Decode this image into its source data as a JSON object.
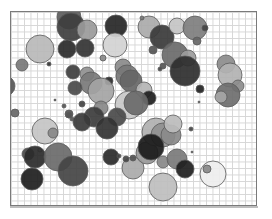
{
  "figure": {
    "frame": {
      "x": 10,
      "y": 11,
      "width": 247,
      "height": 195
    },
    "grid_spacing": 6.5,
    "colors": {
      "grid": "#d6d6d6",
      "border": "#7a7a7a",
      "stroke": "#5a5a5a"
    },
    "circles": [
      {
        "cx": 68,
        "cy": 16,
        "r": 12,
        "fill": "#5c5c5c"
      },
      {
        "cx": 70,
        "cy": 26,
        "r": 14,
        "fill": "#3e3e3e"
      },
      {
        "cx": 86,
        "cy": 29,
        "r": 10,
        "fill": "#9a9a9a"
      },
      {
        "cx": 66,
        "cy": 48,
        "r": 9,
        "fill": "#2a2a2a"
      },
      {
        "cx": 84,
        "cy": 47,
        "r": 9,
        "fill": "#333333"
      },
      {
        "cx": 115,
        "cy": 25,
        "r": 11,
        "fill": "#262626"
      },
      {
        "cx": 114,
        "cy": 44,
        "r": 12,
        "fill": "#d2d2d2"
      },
      {
        "cx": 39,
        "cy": 48,
        "r": 14,
        "fill": "#b8b8b8"
      },
      {
        "cx": 21,
        "cy": 64,
        "r": 6,
        "fill": "#7a7a7a"
      },
      {
        "cx": 48,
        "cy": 63,
        "r": 2,
        "fill": "#333333"
      },
      {
        "cx": 102,
        "cy": 57,
        "r": 3,
        "fill": "#888888"
      },
      {
        "cx": 148,
        "cy": 26,
        "r": 11,
        "fill": "#aaaaaa"
      },
      {
        "cx": 161,
        "cy": 36,
        "r": 12,
        "fill": "#3a3a3a"
      },
      {
        "cx": 176,
        "cy": 25,
        "r": 8,
        "fill": "#c4c4c4"
      },
      {
        "cx": 194,
        "cy": 27,
        "r": 12,
        "fill": "#7e7e7e"
      },
      {
        "cx": 204,
        "cy": 27,
        "r": 3,
        "fill": "#444444"
      },
      {
        "cx": 196,
        "cy": 40,
        "r": 4,
        "fill": "#666666"
      },
      {
        "cx": 141,
        "cy": 17,
        "r": 2,
        "fill": "#777777"
      },
      {
        "cx": 152,
        "cy": 49,
        "r": 4,
        "fill": "#555555"
      },
      {
        "cx": 174,
        "cy": 54,
        "r": 13,
        "fill": "#6a6a6a"
      },
      {
        "cx": 187,
        "cy": 57,
        "r": 8,
        "fill": "#9c9c9c"
      },
      {
        "cx": 184,
        "cy": 70,
        "r": 15,
        "fill": "#2e2e2e"
      },
      {
        "cx": 162,
        "cy": 65,
        "r": 3,
        "fill": "#555555"
      },
      {
        "cx": 159,
        "cy": 68,
        "r": 2,
        "fill": "#444444"
      },
      {
        "cx": 225,
        "cy": 63,
        "r": 9,
        "fill": "#8c8c8c"
      },
      {
        "cx": 229,
        "cy": 74,
        "r": 12,
        "fill": "#b2b2b2"
      },
      {
        "cx": 237,
        "cy": 85,
        "r": 6,
        "fill": "#8c8c8c"
      },
      {
        "cx": 227,
        "cy": 94,
        "r": 12,
        "fill": "#6e6e6e"
      },
      {
        "cx": 220,
        "cy": 96,
        "r": 6,
        "fill": "#a6a6a6"
      },
      {
        "cx": 199,
        "cy": 88,
        "r": 4,
        "fill": "#222222"
      },
      {
        "cx": 198,
        "cy": 101,
        "r": 1,
        "fill": "#555555"
      },
      {
        "cx": 72,
        "cy": 71,
        "r": 7,
        "fill": "#3e3e3e"
      },
      {
        "cx": 86,
        "cy": 73,
        "r": 7,
        "fill": "#909090"
      },
      {
        "cx": 90,
        "cy": 82,
        "r": 11,
        "fill": "#7a7a7a"
      },
      {
        "cx": 108,
        "cy": 80,
        "r": 4,
        "fill": "#2a2a2a"
      },
      {
        "cx": 74,
        "cy": 87,
        "r": 7,
        "fill": "#4a4a4a"
      },
      {
        "cx": 100,
        "cy": 90,
        "r": 13,
        "fill": "#a4a4a4"
      },
      {
        "cx": 122,
        "cy": 66,
        "r": 8,
        "fill": "#8a8a8a"
      },
      {
        "cx": 126,
        "cy": 75,
        "r": 11,
        "fill": "#777777"
      },
      {
        "cx": 130,
        "cy": 80,
        "r": 11,
        "fill": "#666666"
      },
      {
        "cx": 143,
        "cy": 89,
        "r": 8,
        "fill": "#b4b4b4"
      },
      {
        "cx": 148,
        "cy": 97,
        "r": 7,
        "fill": "#1e1e1e"
      },
      {
        "cx": 128,
        "cy": 104,
        "r": 14,
        "fill": "#c8c8c8"
      },
      {
        "cx": 135,
        "cy": 102,
        "r": 12,
        "fill": "#6a6a6a"
      },
      {
        "cx": 100,
        "cy": 107,
        "r": 7,
        "fill": "#888888"
      },
      {
        "cx": 93,
        "cy": 116,
        "r": 10,
        "fill": "#3c3c3c"
      },
      {
        "cx": 116,
        "cy": 116,
        "r": 9,
        "fill": "#4a4a4a"
      },
      {
        "cx": 54,
        "cy": 99,
        "r": 1,
        "fill": "#333333"
      },
      {
        "cx": 63,
        "cy": 105,
        "r": 2,
        "fill": "#555555"
      },
      {
        "cx": 68,
        "cy": 113,
        "r": 4,
        "fill": "#555555"
      },
      {
        "cx": 81,
        "cy": 103,
        "r": 3,
        "fill": "#444444"
      },
      {
        "cx": 4,
        "cy": 85,
        "r": 10,
        "fill": "#555555"
      },
      {
        "cx": 14,
        "cy": 112,
        "r": 4,
        "fill": "#666666"
      },
      {
        "cx": 68,
        "cy": 114,
        "r": 3,
        "fill": "#555555"
      },
      {
        "cx": 44,
        "cy": 130,
        "r": 13,
        "fill": "#c4c4c4"
      },
      {
        "cx": 52,
        "cy": 132,
        "r": 5,
        "fill": "#888888"
      },
      {
        "cx": 39,
        "cy": 149,
        "r": 2,
        "fill": "#cccccc"
      },
      {
        "cx": 27,
        "cy": 153,
        "r": 6,
        "fill": "#4a4a4a"
      },
      {
        "cx": 34,
        "cy": 156,
        "r": 11,
        "fill": "#2a2a2a"
      },
      {
        "cx": 57,
        "cy": 156,
        "r": 14,
        "fill": "#6a6a6a"
      },
      {
        "cx": 72,
        "cy": 170,
        "r": 15,
        "fill": "#444444"
      },
      {
        "cx": 31,
        "cy": 178,
        "r": 11,
        "fill": "#1e1e1e"
      },
      {
        "cx": 71,
        "cy": 118,
        "r": 2,
        "fill": "#555555"
      },
      {
        "cx": 81,
        "cy": 121,
        "r": 9,
        "fill": "#3a3a3a"
      },
      {
        "cx": 106,
        "cy": 127,
        "r": 11,
        "fill": "#333333"
      },
      {
        "cx": 110,
        "cy": 156,
        "r": 8,
        "fill": "#2a2a2a"
      },
      {
        "cx": 118,
        "cy": 155,
        "r": 2,
        "fill": "#444444"
      },
      {
        "cx": 132,
        "cy": 167,
        "r": 11,
        "fill": "#aaaaaa"
      },
      {
        "cx": 132,
        "cy": 157,
        "r": 3,
        "fill": "#555555"
      },
      {
        "cx": 146,
        "cy": 152,
        "r": 11,
        "fill": "#999999"
      },
      {
        "cx": 155,
        "cy": 131,
        "r": 14,
        "fill": "#b0b0b0"
      },
      {
        "cx": 162,
        "cy": 134,
        "r": 12,
        "fill": "#909090"
      },
      {
        "cx": 170,
        "cy": 134,
        "r": 10,
        "fill": "#8a8a8a"
      },
      {
        "cx": 172,
        "cy": 123,
        "r": 9,
        "fill": "#bcbcbc"
      },
      {
        "cx": 150,
        "cy": 146,
        "r": 13,
        "fill": "#1a1a1a"
      },
      {
        "cx": 162,
        "cy": 161,
        "r": 6,
        "fill": "#888888"
      },
      {
        "cx": 176,
        "cy": 158,
        "r": 10,
        "fill": "#7a7a7a"
      },
      {
        "cx": 184,
        "cy": 168,
        "r": 9,
        "fill": "#1e1e1e"
      },
      {
        "cx": 162,
        "cy": 186,
        "r": 14,
        "fill": "#bebebe"
      },
      {
        "cx": 212,
        "cy": 173,
        "r": 13,
        "fill": "#eeeeee"
      },
      {
        "cx": 206,
        "cy": 168,
        "r": 4,
        "fill": "#888888"
      },
      {
        "cx": 190,
        "cy": 128,
        "r": 2,
        "fill": "#444444"
      },
      {
        "cx": 191,
        "cy": 151,
        "r": 1,
        "fill": "#555555"
      },
      {
        "cx": 125,
        "cy": 158,
        "r": 3,
        "fill": "#444444"
      }
    ]
  }
}
